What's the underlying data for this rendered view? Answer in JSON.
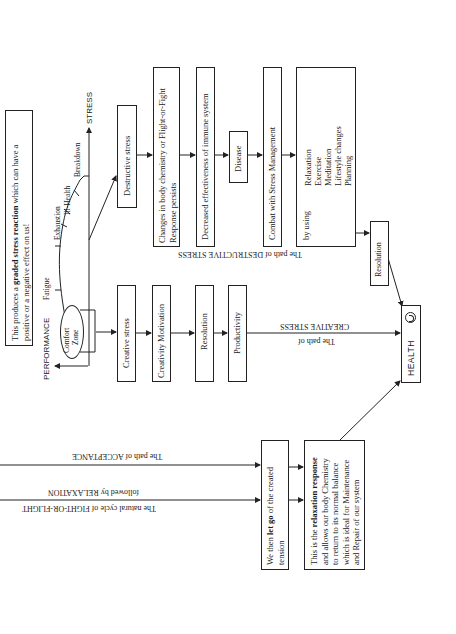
{
  "diagram": {
    "intro_box": {
      "line1_pre": "This produces a ",
      "line1_bold": "graded stress reaction",
      "line1_post": " which can have a",
      "line2": "positive or a negative effect on us!"
    },
    "graph": {
      "y_axis_label": "PERFORMANCE",
      "x_axis_label": "STRESS",
      "comfort_zone": [
        "Comfort",
        "Zone"
      ],
      "curve_labels": [
        "Fatigue",
        "Exhaustion",
        "Ill-Health",
        "Breakdown"
      ]
    },
    "destructive_path": {
      "label": "The path of DESTRUCTIVE STRESS",
      "boxes": [
        {
          "id": "destructive-stress",
          "lines": [
            "Destructive stress"
          ]
        },
        {
          "id": "body-chemistry",
          "lines": [
            "Changes in body chemistry or Flight-or-Fight",
            "Response persists"
          ]
        },
        {
          "id": "immune",
          "lines": [
            "Decreased effectiveness of immune system"
          ]
        },
        {
          "id": "disease",
          "lines": [
            "Disease"
          ]
        },
        {
          "id": "combat",
          "lines": [
            "Combat with Stress Management"
          ]
        }
      ],
      "by_using": {
        "label": "by using",
        "items": [
          "Relaxation",
          "Exercise",
          "Meditation",
          "Lifestyle changes",
          "Planning"
        ]
      },
      "resolution": "Resolution"
    },
    "creative_path": {
      "label_line1": "CREATIVE STRESS",
      "label_line2": "The path of",
      "boxes": [
        {
          "id": "creative-stress",
          "lines": [
            "Creative stress"
          ]
        },
        {
          "id": "creativity-motivation",
          "lines": [
            "Creativity Motivation"
          ]
        },
        {
          "id": "resolution",
          "lines": [
            "Resolution"
          ]
        },
        {
          "id": "productivity",
          "lines": [
            "Productivity"
          ]
        }
      ]
    },
    "health": {
      "label": "HEALTH",
      "icon": "smiley-icon"
    },
    "acceptance_path": {
      "label": "The path of ACCEPTANCE"
    },
    "relaxation_path": {
      "label_line1": "followed by RELAXATION",
      "label_line2": "The natural cycle of FIGHT-OR-FLIGHT"
    },
    "let_go_box": {
      "line1_pre": "We then ",
      "line1_bold": "let go",
      "line1_post": " of the created",
      "line2": "tension"
    },
    "relaxation_box": {
      "line1_pre": "This is the ",
      "line1_bold": "relaxation response",
      "line2": "and allows our body Chemistry",
      "line3": "to return to its normal balance",
      "line4": "which is ideal for Maintenance",
      "line5": "and Repair of our system"
    }
  }
}
